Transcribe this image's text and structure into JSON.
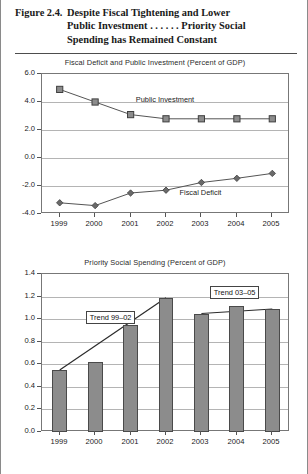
{
  "figure": {
    "number": "Figure 2.4.",
    "caption_lines": [
      "Despite Fiscal Tightening and Lower",
      "Public Investment . . . . . . Priority Social",
      "Spending has Remained Constant"
    ]
  },
  "colors": {
    "bar_fill": "#8c8c8c",
    "bar_stroke": "#4a4a4a",
    "line": "#555555",
    "grid": "#b4b4b4",
    "frame": "#777777",
    "text": "#222222"
  },
  "chart_data": [
    {
      "id": "fiscal-deficit-public-investment",
      "type": "line",
      "title": "Fiscal Deficit and Public Investment (Percent of GDP)",
      "xlabel": "",
      "ylabel": "",
      "x": [
        "1999",
        "2000",
        "2001",
        "2002",
        "2003",
        "2004",
        "2005"
      ],
      "ylim": [
        -4.0,
        6.0
      ],
      "yticks": [
        "6.0",
        "4.0",
        "2.0",
        "0.0",
        "-2.0",
        "-4.0"
      ],
      "ytick_values": [
        6.0,
        4.0,
        2.0,
        0.0,
        -2.0,
        -4.0
      ],
      "grid": true,
      "legend": "inline-annotations",
      "series": [
        {
          "name": "Public Investment",
          "marker": "square",
          "values": [
            4.9,
            4.0,
            3.1,
            2.8,
            2.8,
            2.8,
            2.8
          ],
          "label_x": "2002",
          "label_text": "Public Investment"
        },
        {
          "name": "Fiscal Deficit",
          "marker": "diamond",
          "values": [
            -3.2,
            -3.4,
            -2.5,
            -2.3,
            -1.75,
            -1.45,
            -1.1
          ],
          "label_x": "2003",
          "label_text": "Fiscal Deficit"
        }
      ]
    },
    {
      "id": "priority-social-spending",
      "type": "bar",
      "title": "Priority Social Spending (Percent of GDP)",
      "xlabel": "",
      "ylabel": "",
      "categories": [
        "1999",
        "2000",
        "2001",
        "2002",
        "2003",
        "2004",
        "2005"
      ],
      "values": [
        0.55,
        0.62,
        0.95,
        1.19,
        1.05,
        1.12,
        1.09
      ],
      "ylim": [
        0.0,
        1.4
      ],
      "yticks": [
        "1.4",
        "1.2",
        "1.0",
        "0.8",
        "0.6",
        "0.4",
        "0.2",
        "0.0"
      ],
      "ytick_values": [
        1.4,
        1.2,
        1.0,
        0.8,
        0.6,
        0.4,
        0.2,
        0.0
      ],
      "grid": true,
      "annotations": [
        {
          "name": "trend-99-02",
          "label": "Trend 99–02",
          "from_x": "1999",
          "from_y": 0.55,
          "to_x": "2002",
          "to_y": 1.19
        },
        {
          "name": "trend-03-05",
          "label": "Trend 03–05",
          "from_x": "2003",
          "from_y": 1.05,
          "to_x": "2005",
          "to_y": 1.09
        }
      ]
    }
  ]
}
